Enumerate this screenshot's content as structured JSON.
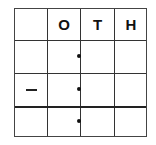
{
  "place_value_chart": {
    "headers": [
      "",
      "O",
      "T",
      "H"
    ],
    "rows": [
      {
        "label": "",
        "dot": true
      },
      {
        "label": "−",
        "dot": true
      },
      {
        "label": "",
        "dot": true
      }
    ],
    "operator": "minus"
  }
}
